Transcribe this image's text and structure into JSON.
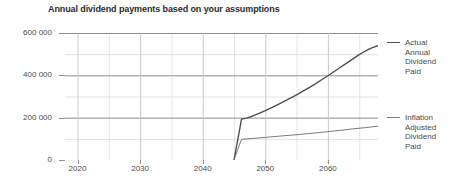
{
  "chart_data": {
    "type": "line",
    "title": "Annual dividend payments based on your assumptions",
    "xlabel": "",
    "ylabel": "",
    "xlim": [
      2018,
      2068
    ],
    "ylim": [
      0,
      600000
    ],
    "grid": true,
    "x_major_ticks": [
      2020,
      2030,
      2040,
      2050,
      2060
    ],
    "x_minor_ticks": [
      2025,
      2035,
      2045,
      2055,
      2065
    ],
    "x_tick_labels": [
      "2020",
      "2030",
      "2040",
      "2050",
      "2060"
    ],
    "y_major_ticks": [
      0,
      200000,
      400000,
      600000
    ],
    "y_minor_ticks": [
      100000,
      300000,
      500000
    ],
    "y_tick_labels": [
      "0",
      "200 000",
      "400 000",
      "600 000"
    ],
    "legend_position": "right",
    "series": [
      {
        "name": "Actual Annual Dividend Paid",
        "legend_label": "Actual\nAnnual\nDividend\nPaid",
        "color": "#4f4f4f",
        "width": 1.4,
        "x": [
          2045,
          2045.6,
          2046.2,
          2047,
          2048,
          2049,
          2050,
          2051,
          2052,
          2053,
          2054,
          2055,
          2056,
          2057,
          2058,
          2059,
          2060,
          2061,
          2062,
          2063,
          2064,
          2065,
          2066,
          2067,
          2068
        ],
        "y": [
          0,
          96000,
          193000,
          198000,
          208000,
          220000,
          233000,
          247000,
          262000,
          277000,
          292000,
          308000,
          325000,
          342000,
          360000,
          379000,
          398000,
          418000,
          438000,
          458000,
          478000,
          498000,
          515000,
          530000,
          540000
        ]
      },
      {
        "name": "Inflation Adjusted Dividend Paid",
        "legend_label": "Inflation\nAdjusted\nDividend\nPaid",
        "color": "#7a7a7a",
        "width": 1.0,
        "x": [
          2045,
          2045.6,
          2046.2,
          2048,
          2050,
          2052,
          2054,
          2056,
          2058,
          2060,
          2062,
          2064,
          2066,
          2068
        ],
        "y": [
          0,
          49000,
          98000,
          102000,
          107000,
          112000,
          117000,
          122000,
          128000,
          134000,
          140000,
          147000,
          153000,
          160000
        ]
      }
    ]
  }
}
